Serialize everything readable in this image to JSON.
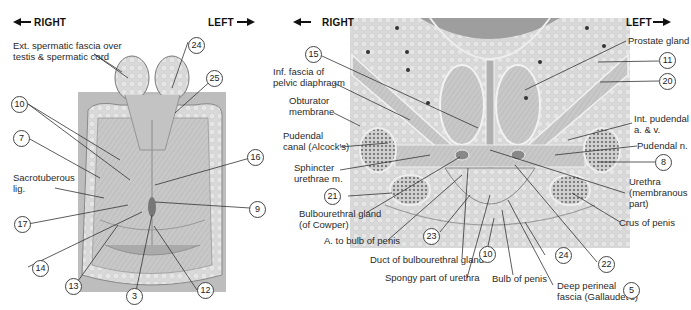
{
  "left_figure": {
    "direction_right": "RIGHT",
    "direction_left": "LEFT",
    "labels": {
      "ext_spermatic": "Ext. spermatic fascia over\ntestis & spermatic cord",
      "sacrotuberous": "Sacrotuberous\nlig."
    },
    "numbers": [
      "24",
      "25",
      "10",
      "7",
      "16",
      "9",
      "17",
      "14",
      "13",
      "3",
      "12"
    ]
  },
  "right_figure": {
    "direction_right": "RIGHT",
    "direction_left": "LEFT",
    "labels": {
      "inf_fascia": "Inf. fascia of\npelvic diaphragm",
      "obturator": "Obturator\nmembrane",
      "pudendal_canal": "Pudendal\ncanal (Alcock's)",
      "sphincter": "Sphincter\nurethrae m.",
      "bulbourethral": "Bulbourethral gland\n(of Cowper)",
      "a_bulb": "A. to bulb of penis",
      "duct_bulbo": "Duct of bulbourethral gland",
      "spongy": "Spongy part of urethra",
      "bulb_penis": "Bulb of penis",
      "deep_perineal": "Deep perineal\nfascia (Gallaudet's)",
      "prostate": "Prostate gland",
      "int_pudendal": "Int. pudendal\na. & v.",
      "pudendal_n": "Pudendal n.",
      "urethra": "Urethra\n(membranous\npart)",
      "crus": "Crus of penis"
    },
    "numbers": [
      "15",
      "11",
      "20",
      "8",
      "21",
      "23",
      "10",
      "24",
      "22",
      "5"
    ]
  }
}
